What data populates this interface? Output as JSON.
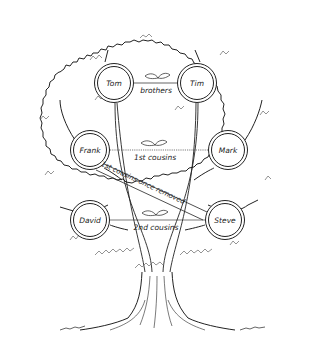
{
  "diagram": {
    "type": "family-tree-illustration",
    "nodes": [
      {
        "id": "tom",
        "label": "Tom",
        "x": 114,
        "y": 83
      },
      {
        "id": "tim",
        "label": "Tim",
        "x": 197,
        "y": 83
      },
      {
        "id": "frank",
        "label": "Frank",
        "x": 90,
        "y": 150
      },
      {
        "id": "mark",
        "label": "Mark",
        "x": 228,
        "y": 150
      },
      {
        "id": "david",
        "label": "David",
        "x": 90,
        "y": 220
      },
      {
        "id": "steve",
        "label": "Steve",
        "x": 225,
        "y": 220
      }
    ],
    "relationships": [
      {
        "from": "tom",
        "to": "tim",
        "label": "brothers"
      },
      {
        "from": "frank",
        "to": "mark",
        "label": "1st cousins"
      },
      {
        "from": "frank",
        "to": "steve",
        "label": "1st cousins once removed"
      },
      {
        "from": "david",
        "to": "steve",
        "label": "2nd cousins"
      }
    ],
    "colors": {
      "line": "#222222",
      "foliage": "#555555",
      "background": "#ffffff"
    }
  }
}
